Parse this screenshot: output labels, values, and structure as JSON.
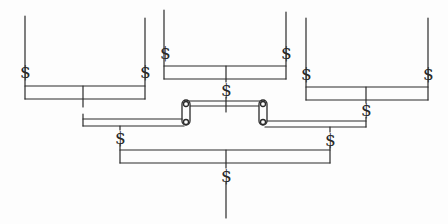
{
  "diagram": {
    "type": "bracket-tree",
    "symbol": "$",
    "colors": {
      "line": "#2a2a2a",
      "background": "#fdfdfd"
    },
    "nodes": {
      "top_left": {
        "label": "$",
        "count": 2
      },
      "top_center": {
        "label": "$",
        "count": 2
      },
      "top_right": {
        "label": "$",
        "count": 2
      },
      "center_join": {
        "label": "$"
      },
      "right_join": {
        "label": "$"
      },
      "mid_left": {
        "label": "$"
      },
      "mid_right": {
        "label": "$"
      },
      "root": {
        "label": "$"
      }
    },
    "scrolls": [
      "scroll-left",
      "scroll-right"
    ]
  },
  "labels": {
    "tl_a": "$",
    "tl_b": "$",
    "tc_a": "$",
    "tc_b": "$",
    "tr_a": "$",
    "tr_b": "$",
    "center": "$",
    "right_join": "$",
    "mid_left": "$",
    "mid_right": "$",
    "root": "$"
  }
}
